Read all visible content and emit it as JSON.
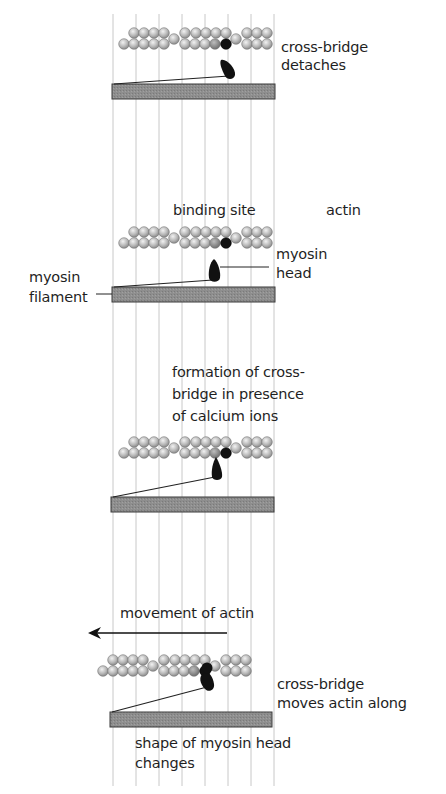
{
  "grid": {
    "lines_x": [
      113,
      136,
      159,
      182,
      205,
      228,
      251,
      274
    ],
    "y_top": 14,
    "y_bottom": 786,
    "color": "#c8c8c8"
  },
  "colors": {
    "actin_bead": "#b8b8b8",
    "actin_bead_edge": "#6e6e6e",
    "binding_site_grey": "#8a8a8a",
    "myosin_head": "#111111",
    "filament": "#8c8c8c",
    "filament_edge": "#333333"
  },
  "panels": [
    {
      "id": "detach",
      "actin_offset_x": 0,
      "actin_y": 33,
      "filament": {
        "x": 112,
        "y": 84,
        "w": 163,
        "h": 15
      },
      "labels": [
        {
          "text": "cross-bridge",
          "x": 281,
          "y": 39
        },
        {
          "text": "detaches",
          "x": 281,
          "y": 57
        }
      ]
    },
    {
      "id": "rest",
      "actin_offset_x": 0,
      "actin_y": 232,
      "filament": {
        "x": 112,
        "y": 287,
        "w": 163,
        "h": 15
      },
      "labels": [
        {
          "text": "binding site",
          "x": 173,
          "y": 202
        },
        {
          "text": "actin",
          "x": 326,
          "y": 202
        },
        {
          "text": "myosin",
          "x": 276,
          "y": 247
        },
        {
          "text": "head",
          "x": 276,
          "y": 265
        },
        {
          "text": "myosin",
          "x": 29,
          "y": 270
        },
        {
          "text": "filament",
          "x": 29,
          "y": 290
        }
      ]
    },
    {
      "id": "attach",
      "actin_offset_x": 0,
      "actin_y": 442,
      "filament": {
        "x": 111,
        "y": 497,
        "w": 163,
        "h": 15
      },
      "labels": [
        {
          "text": "formation of cross-",
          "x": 172,
          "y": 364
        },
        {
          "text": "bridge in presence",
          "x": 172,
          "y": 387
        },
        {
          "text": "of calcium ions",
          "x": 172,
          "y": 410
        }
      ]
    },
    {
      "id": "powerstroke",
      "actin_offset_x": -21,
      "actin_y": 660,
      "filament": {
        "x": 110,
        "y": 712,
        "w": 162,
        "h": 15
      },
      "labels": [
        {
          "text": "movement of actin",
          "x": 120,
          "y": 606
        },
        {
          "text": "cross-bridge",
          "x": 277,
          "y": 676
        },
        {
          "text": "moves actin along",
          "x": 277,
          "y": 696
        },
        {
          "text": "shape of myosin head",
          "x": 135,
          "y": 735
        },
        {
          "text": "changes",
          "x": 135,
          "y": 755
        }
      ]
    }
  ],
  "arrow": {
    "label": "movement of actin",
    "x1": 227,
    "x2": 88,
    "y": 633
  }
}
